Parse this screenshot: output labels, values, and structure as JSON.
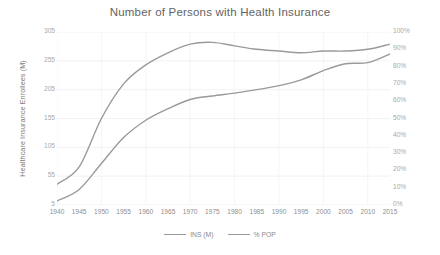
{
  "chart_data": {
    "type": "line",
    "title": "Number of Persons with Health Insurance",
    "xlabel": "",
    "ylabel": "Healthcare Insurance Enrollees (M)",
    "y2label": "",
    "grid": true,
    "legend_position": "bottom",
    "categories": [
      "1940",
      "1945",
      "1950",
      "1955",
      "1960",
      "1965",
      "1970",
      "1975",
      "1980",
      "1985",
      "1990",
      "1995",
      "2000",
      "2005",
      "2010",
      "2015"
    ],
    "x": [
      1940,
      1945,
      1950,
      1955,
      1960,
      1965,
      1970,
      1975,
      1980,
      1985,
      1990,
      1995,
      2000,
      2005,
      2010,
      2015
    ],
    "ylim": [
      5,
      305
    ],
    "yticks": [
      305,
      255,
      205,
      155,
      105,
      55,
      5
    ],
    "ytick_labels": [
      "305",
      "255",
      "205",
      "155",
      "105",
      "55",
      "5"
    ],
    "y2lim": [
      0,
      100
    ],
    "y2ticks": [
      100,
      90,
      80,
      70,
      60,
      50,
      40,
      30,
      20,
      10,
      0
    ],
    "y2tick_labels": [
      "100%",
      "90%",
      "80%",
      "70%",
      "60%",
      "50%",
      "40%",
      "30%",
      "20%",
      "10%",
      "0%"
    ],
    "series": [
      {
        "name": "INS (M)",
        "axis": "left",
        "color": "#9a9a9a",
        "values": [
          12,
          32,
          77,
          122,
          152,
          172,
          188,
          194,
          199,
          205,
          212,
          222,
          238,
          250,
          252,
          267
        ]
      },
      {
        "name": "% POP",
        "axis": "right",
        "color": "#9a9a9a",
        "values": [
          12,
          22,
          50,
          70,
          81,
          88,
          93,
          94,
          92,
          90,
          89,
          88,
          89,
          89,
          90,
          93
        ]
      }
    ]
  },
  "legend": {
    "items": [
      {
        "label": "INS (M)"
      },
      {
        "label": "% POP"
      }
    ]
  }
}
